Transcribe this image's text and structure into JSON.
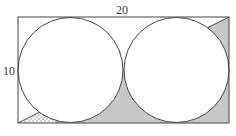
{
  "figure": {
    "type": "geometry-diagram",
    "labels": {
      "width_label": "20",
      "height_label": "10"
    },
    "rectangle": {
      "width": 20,
      "height": 10
    },
    "circles": [
      {
        "id": "left-circle",
        "radius": 5
      },
      {
        "id": "right-circle",
        "radius": 5
      }
    ],
    "regions": {
      "shaded": {
        "fill": "#c8c8c8",
        "description": "region below the diagonal outside both circles (right part)"
      },
      "dotted": {
        "fill": "#ffffff",
        "pattern": "dots",
        "description": "small corner region at bottom-left between diagonal, bottom edge, and left circle"
      }
    },
    "colors": {
      "stroke": "#444444",
      "shade": "#c8c8c8",
      "background": "#ffffff"
    }
  }
}
